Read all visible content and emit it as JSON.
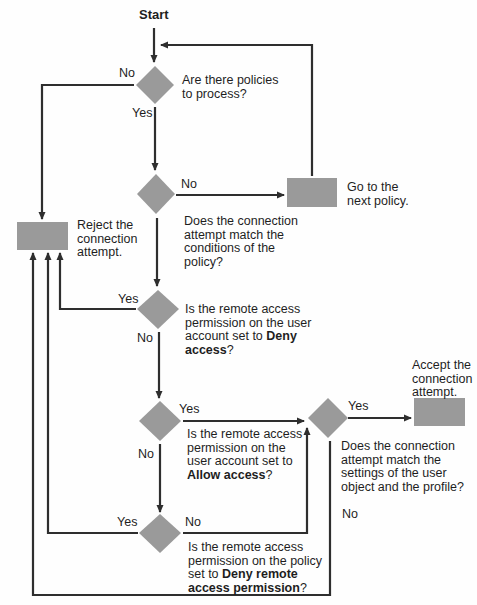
{
  "diagram": {
    "type": "flowchart",
    "colors": {
      "shape_fill": "#9a9a9a",
      "line": "#2e2e2e",
      "text": "#1e1e1e"
    },
    "start_label": "Start",
    "decisions": [
      {
        "id": "d1",
        "lines": [
          "Are there policies",
          "to process?"
        ],
        "yes": "Yes",
        "no": "No"
      },
      {
        "id": "d2",
        "lines": [
          "Does the connection",
          "attempt match the",
          "conditions of the",
          "policy?"
        ],
        "no": "No"
      },
      {
        "id": "d3",
        "lines": [
          "Is the remote access",
          "permission on the user",
          "account set to "
        ],
        "bold_1": "Deny",
        "line4_bold": "access",
        "line4_rest": "?",
        "yes": "Yes",
        "no": "No"
      },
      {
        "id": "d4",
        "lines": [
          "Is the remote access",
          "permission on the",
          "user account set to"
        ],
        "line4_bold": "Allow access",
        "line4_rest": "?",
        "yes": "Yes",
        "no": "No"
      },
      {
        "id": "d5",
        "lines": [
          "Does the connection",
          "attempt match the",
          "settings of the user",
          "object and the profile?"
        ],
        "yes": "Yes",
        "no": "No"
      },
      {
        "id": "d6",
        "lines": [
          "Is the remote access",
          "permission on the policy",
          "set to "
        ],
        "bold_1": "Deny remote",
        "line4_bold": "access permission",
        "line4_rest": "?",
        "yes": "Yes",
        "no": "No"
      }
    ],
    "actions": [
      {
        "id": "reject",
        "lines": [
          "Reject the",
          "connection",
          "attempt."
        ]
      },
      {
        "id": "next",
        "lines": [
          "Go to the",
          "next policy."
        ]
      },
      {
        "id": "accept",
        "lines": [
          "Accept the",
          "connection",
          "attempt."
        ]
      }
    ]
  }
}
